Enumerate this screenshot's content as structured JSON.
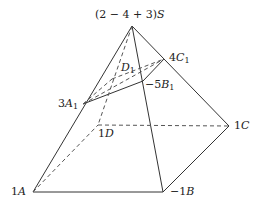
{
  "diagram": {
    "colors": {
      "line": "#333333",
      "dashed": "#555555",
      "text": "#222222"
    },
    "points": {
      "S": {
        "x": 132,
        "y": 26
      },
      "A": {
        "x": 33,
        "y": 192
      },
      "B": {
        "x": 163,
        "y": 192
      },
      "C": {
        "x": 229,
        "y": 126
      },
      "D": {
        "x": 98,
        "y": 125
      },
      "A1": {
        "x": 83,
        "y": 104
      },
      "B1": {
        "x": 143,
        "y": 81
      },
      "C1": {
        "x": 164,
        "y": 59
      },
      "D1": {
        "x": 112,
        "y": 79
      }
    },
    "labels": {
      "S": {
        "coef": "(2 − 4 + 3)",
        "name": "S"
      },
      "A": {
        "coef": "1",
        "name": "A"
      },
      "B": {
        "coef": "−1",
        "name": "B"
      },
      "C": {
        "coef": "1",
        "name": "C"
      },
      "D": {
        "coef": "1",
        "name": "D"
      },
      "A1": {
        "coef": "3",
        "name": "A",
        "sub": "1"
      },
      "B1": {
        "coef": "−5",
        "name": "B",
        "sub": "1"
      },
      "C1": {
        "coef": "4",
        "name": "C",
        "sub": "1"
      },
      "D1": {
        "coef": "",
        "name": "D",
        "sub": "1"
      }
    }
  }
}
